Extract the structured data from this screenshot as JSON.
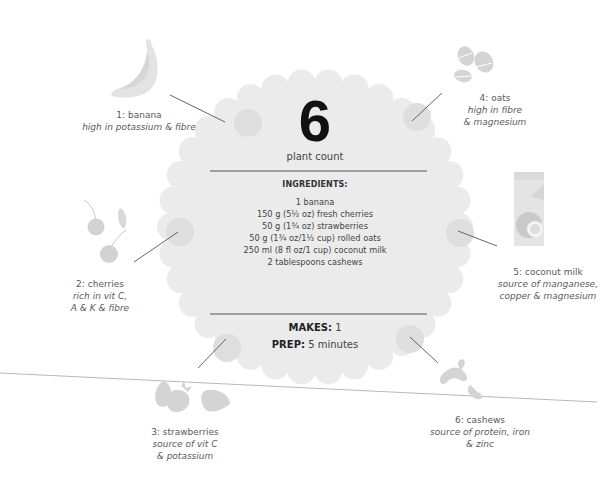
{
  "plant_count": {
    "number": "6",
    "label": "plant count"
  },
  "ingredients": {
    "title": "INGREDIENTS:",
    "items": [
      "1 banana",
      "150 g (5½ oz) fresh cherries",
      "50 g (1¾ oz) strawberries",
      "50 g (1¾ oz/1½ cup) rolled oats",
      "250 ml (8 fl oz/1 cup) coconut milk",
      "2 tablespoons cashews"
    ]
  },
  "makes": {
    "label": "MAKES:",
    "value": "1"
  },
  "prep": {
    "label": "PREP:",
    "value": "5 minutes"
  },
  "plants": [
    {
      "name": "1: banana",
      "benefit_lines": [
        "high in potassium & fibre"
      ],
      "icon": "banana-icon"
    },
    {
      "name": "2: cherries",
      "benefit_lines": [
        "rich in vit C,",
        "A & K & fibre"
      ],
      "icon": "cherries-icon"
    },
    {
      "name": "3: strawberries",
      "benefit_lines": [
        "source of vit C",
        "& potassium"
      ],
      "icon": "strawberries-icon"
    },
    {
      "name": "4: oats",
      "benefit_lines": [
        "high in fibre",
        "& magnesium"
      ],
      "icon": "oats-icon"
    },
    {
      "name": "5: coconut milk",
      "benefit_lines": [
        "source of manganese,",
        "copper & magnesium"
      ],
      "icon": "coconut-milk-carton-icon"
    },
    {
      "name": "6: cashews",
      "benefit_lines": [
        "source of protein, iron",
        "& zinc"
      ],
      "icon": "cashews-icon"
    }
  ],
  "colors": {
    "badge_fill": "#ebebeb",
    "dot_fill": "#dedede",
    "icon_fill": "#d4d4d4",
    "text": "#555555",
    "numeral": "#111111"
  }
}
